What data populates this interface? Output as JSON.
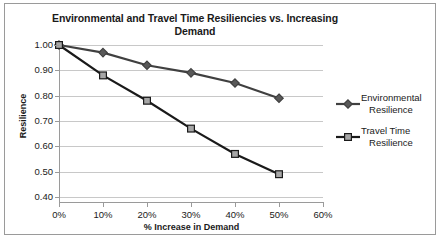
{
  "chart_data": {
    "type": "line",
    "title": "Environmental  and Travel Time Resiliencies vs. Increasing Demand",
    "xlabel": "% Increase in Demand",
    "ylabel": "Resilience",
    "x": [
      0,
      10,
      20,
      30,
      40,
      50
    ],
    "categories": [
      "0%",
      "10%",
      "20%",
      "30%",
      "40%",
      "50%"
    ],
    "xtick_labels": [
      "0%",
      "10%",
      "20%",
      "30%",
      "40%",
      "50%",
      "60%"
    ],
    "ytick_labels": [
      "0.40",
      "0.50",
      "0.60",
      "0.70",
      "0.80",
      "0.90",
      "1.00"
    ],
    "xlim": [
      0,
      60
    ],
    "ylim": [
      0.4,
      1.0
    ],
    "grid": true,
    "legend_position": "right",
    "series": [
      {
        "name": "Environmental Resilience",
        "name_line1": "Environmental",
        "name_line2": "Resilience",
        "marker": "diamond",
        "color": "#404040",
        "marker_fill": "#595959",
        "values": [
          1.0,
          0.97,
          0.92,
          0.89,
          0.85,
          0.79
        ]
      },
      {
        "name": "Travel Time Resilience",
        "name_line1": "Travel Time",
        "name_line2": "Resilience",
        "marker": "square",
        "color": "#1a1a1a",
        "marker_fill": "#a6a6a6",
        "values": [
          1.0,
          0.88,
          0.78,
          0.67,
          0.57,
          0.49
        ]
      }
    ]
  }
}
